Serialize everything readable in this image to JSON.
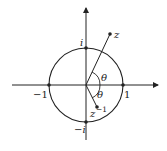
{
  "diagram": {
    "labels": {
      "i": "i",
      "neg_i": "−i",
      "one": "1",
      "neg_one": "−1",
      "z": "z",
      "z_inv_base": "z",
      "z_inv_exp": "−1",
      "theta_upper": "θ",
      "theta_lower": "θ"
    },
    "points": [
      {
        "name": "one",
        "x": 1,
        "y": 0
      },
      {
        "name": "neg_one",
        "x": -1,
        "y": 0
      },
      {
        "name": "i",
        "x": 0,
        "y": 1
      },
      {
        "name": "neg_i",
        "x": 0,
        "y": -1
      },
      {
        "name": "z",
        "x": 0.65,
        "y": 1.38
      },
      {
        "name": "z_inverse",
        "x": 0.3,
        "y": -0.6
      }
    ],
    "colors": {
      "stroke": "#222222",
      "background": "#ffffff"
    }
  }
}
